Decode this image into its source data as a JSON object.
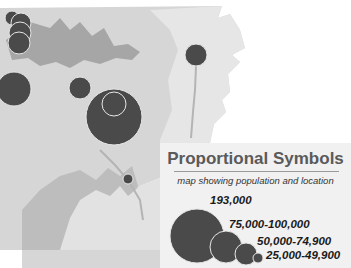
{
  "map": {
    "subject": "Arkansas",
    "colors": {
      "background": "#ffffff",
      "land_light": "#dcdcdc",
      "land_mid": "#c4c4c4",
      "land_dark": "#a2a2a2",
      "river": "#b0b0b0",
      "symbol_fill": "#4a4a4a",
      "symbol_stroke": "#e6e6e6"
    },
    "symbols": [
      {
        "cx": 12,
        "cy": 18,
        "r": 7
      },
      {
        "cx": 21,
        "cy": 23,
        "r": 10
      },
      {
        "cx": 20,
        "cy": 33,
        "r": 11
      },
      {
        "cx": 19,
        "cy": 43,
        "r": 11
      },
      {
        "cx": 14,
        "cy": 89,
        "r": 17
      },
      {
        "cx": 80,
        "cy": 88,
        "r": 11
      },
      {
        "cx": 114,
        "cy": 117,
        "r": 28
      },
      {
        "cx": 114,
        "cy": 104,
        "r": 12
      },
      {
        "cx": 196,
        "cy": 55,
        "r": 11
      },
      {
        "cx": 128,
        "cy": 179,
        "r": 5
      }
    ]
  },
  "legend": {
    "title": "Proportional Symbols",
    "subtitle": "map showing population and location",
    "classes": [
      {
        "label": "193,000",
        "r": 27
      },
      {
        "label": "75,000-100,000",
        "r": 16
      },
      {
        "label": "50,000-74,900",
        "r": 11
      },
      {
        "label": "25,000-49,900",
        "r": 5
      }
    ]
  }
}
